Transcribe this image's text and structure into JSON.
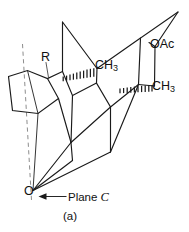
{
  "figure": {
    "caption": "(a)",
    "domain_kind": "chemical-structure-diagram",
    "background_color": "#ffffff",
    "bond_color": "#1a1a1a",
    "plane_line_color": "#8d8d8d"
  },
  "labels": {
    "substituent_r": "R",
    "methyl_upper": "CH",
    "methyl_upper_subscript": "3",
    "methyl_lower": "CH",
    "methyl_lower_subscript": "3",
    "acetoxy": "OAc",
    "oxygen": "O",
    "plane_text": "Plane ",
    "plane_letter": "C"
  },
  "annotations": {
    "plane_arrow": "arrow pointing left toward dashed plane line",
    "hashed_wedge_upper": "hashed wedge bond to upper CH3",
    "hashed_wedge_lower": "hashed wedge bond to lower CH3",
    "r_leader": "leader line from R label to ring vertex"
  }
}
